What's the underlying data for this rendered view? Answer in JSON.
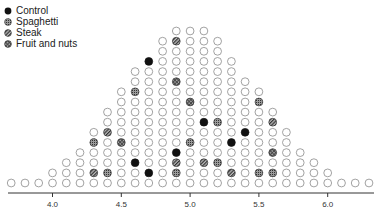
{
  "chart_data": {
    "type": "scatter",
    "subtype": "dot-histogram",
    "title": "",
    "xlabel": "",
    "ylabel": "",
    "xlim": [
      3.65,
      6.35
    ],
    "x_ticks": [
      4.0,
      4.5,
      5.0,
      5.5,
      6.0
    ],
    "x_tick_labels": [
      "4.0",
      "4.5",
      "5.0",
      "5.5",
      "6.0"
    ],
    "bin_width": 0.1,
    "grid": false,
    "legend_position": "top-left",
    "legend": [
      {
        "key": "control",
        "label": "Control",
        "fill": "#111111",
        "pattern": "solid"
      },
      {
        "key": "spaghetti",
        "label": "Spaghetti",
        "fill": "#555555",
        "pattern": "dotted"
      },
      {
        "key": "steak",
        "label": "Steak",
        "fill": "#666666",
        "pattern": "hatched"
      },
      {
        "key": "fruit",
        "label": "Fruit and nuts",
        "fill": "#777777",
        "pattern": "cross-hatched"
      }
    ],
    "columns": [
      {
        "x": 3.7,
        "count": 1,
        "marked": {}
      },
      {
        "x": 3.8,
        "count": 1,
        "marked": {}
      },
      {
        "x": 3.9,
        "count": 1,
        "marked": {}
      },
      {
        "x": 4.0,
        "count": 2,
        "marked": {}
      },
      {
        "x": 4.1,
        "count": 3,
        "marked": {}
      },
      {
        "x": 4.2,
        "count": 4,
        "marked": {}
      },
      {
        "x": 4.3,
        "count": 6,
        "marked": {
          "2": "steak",
          "5": "spaghetti"
        }
      },
      {
        "x": 4.4,
        "count": 8,
        "marked": {
          "2": "spaghetti",
          "6": "steak"
        }
      },
      {
        "x": 4.5,
        "count": 10,
        "marked": {
          "5": "fruit"
        }
      },
      {
        "x": 4.6,
        "count": 12,
        "marked": {
          "3": "control",
          "10": "spaghetti"
        }
      },
      {
        "x": 4.7,
        "count": 13,
        "marked": {
          "2": "control",
          "13": "control"
        }
      },
      {
        "x": 4.8,
        "count": 15,
        "marked": {}
      },
      {
        "x": 4.9,
        "count": 16,
        "marked": {
          "2": "spaghetti",
          "3": "steak",
          "4": "control",
          "11": "fruit",
          "15": "steak"
        }
      },
      {
        "x": 5.0,
        "count": 16,
        "marked": {
          "5": "spaghetti",
          "9": "fruit"
        }
      },
      {
        "x": 5.1,
        "count": 16,
        "marked": {
          "3": "steak",
          "7": "control"
        }
      },
      {
        "x": 5.2,
        "count": 15,
        "marked": {
          "3": "spaghetti",
          "7": "spaghetti"
        }
      },
      {
        "x": 5.3,
        "count": 13,
        "marked": {
          "2": "steak",
          "5": "control"
        }
      },
      {
        "x": 5.4,
        "count": 11,
        "marked": {
          "6": "control"
        }
      },
      {
        "x": 5.5,
        "count": 10,
        "marked": {
          "2": "spaghetti",
          "9": "spaghetti"
        }
      },
      {
        "x": 5.6,
        "count": 8,
        "marked": {
          "2": "spaghetti",
          "4": "fruit",
          "7": "steak"
        }
      },
      {
        "x": 5.7,
        "count": 6,
        "marked": {}
      },
      {
        "x": 5.8,
        "count": 4,
        "marked": {}
      },
      {
        "x": 5.9,
        "count": 3,
        "marked": {}
      },
      {
        "x": 6.0,
        "count": 2,
        "marked": {}
      },
      {
        "x": 6.1,
        "count": 1,
        "marked": {}
      },
      {
        "x": 6.2,
        "count": 1,
        "marked": {}
      },
      {
        "x": 6.3,
        "count": 1,
        "marked": {}
      }
    ]
  }
}
